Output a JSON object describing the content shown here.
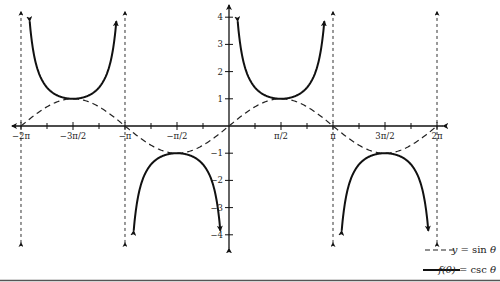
{
  "chart_data": {
    "type": "line",
    "title": "",
    "xlabel": "",
    "ylabel": "",
    "xlim": [
      -6.2832,
      6.2832
    ],
    "ylim": [
      -4,
      4
    ],
    "grid": false,
    "legend_position": "bottom-right",
    "x_ticks": [
      {
        "value": -6.2832,
        "label": "−2π"
      },
      {
        "value": -4.7124,
        "label": "−3π/2"
      },
      {
        "value": -3.1416,
        "label": "−π"
      },
      {
        "value": -1.5708,
        "label": "−π/2"
      },
      {
        "value": 1.5708,
        "label": "π/2"
      },
      {
        "value": 3.1416,
        "label": "π"
      },
      {
        "value": 4.7124,
        "label": "3π/2"
      },
      {
        "value": 6.2832,
        "label": "2π"
      }
    ],
    "y_ticks": [
      {
        "value": 4,
        "label": "4"
      },
      {
        "value": 3,
        "label": "3"
      },
      {
        "value": 2,
        "label": "2"
      },
      {
        "value": 1,
        "label": "1"
      },
      {
        "value": -1,
        "label": "−1"
      },
      {
        "value": -2,
        "label": "−2"
      },
      {
        "value": -3,
        "label": "−3"
      },
      {
        "value": -4,
        "label": "−4"
      }
    ],
    "series": [
      {
        "name": "y = sin θ",
        "style": "dashed",
        "function": "sin",
        "x": [
          -6.2832,
          -4.7124,
          -3.1416,
          -1.5708,
          0,
          1.5708,
          3.1416,
          4.7124,
          6.2832
        ],
        "values": [
          0,
          1,
          0,
          -1,
          0,
          1,
          0,
          -1,
          0
        ]
      },
      {
        "name": "f(θ) = csc θ",
        "style": "solid",
        "function": "csc",
        "x": [
          -4.7124,
          -1.5708,
          1.5708,
          4.7124
        ],
        "values": [
          1,
          -1,
          1,
          -1
        ]
      }
    ],
    "asymptotes": [
      -6.2832,
      -3.1416,
      0,
      3.1416,
      6.2832
    ],
    "legend": [
      {
        "style": "dashed",
        "label_prefix": "y",
        "label_rest": " = sin ",
        "label_var": "θ"
      },
      {
        "style": "solid",
        "label_prefix": "f(θ)",
        "label_rest": " = csc ",
        "label_var": "θ"
      }
    ]
  }
}
